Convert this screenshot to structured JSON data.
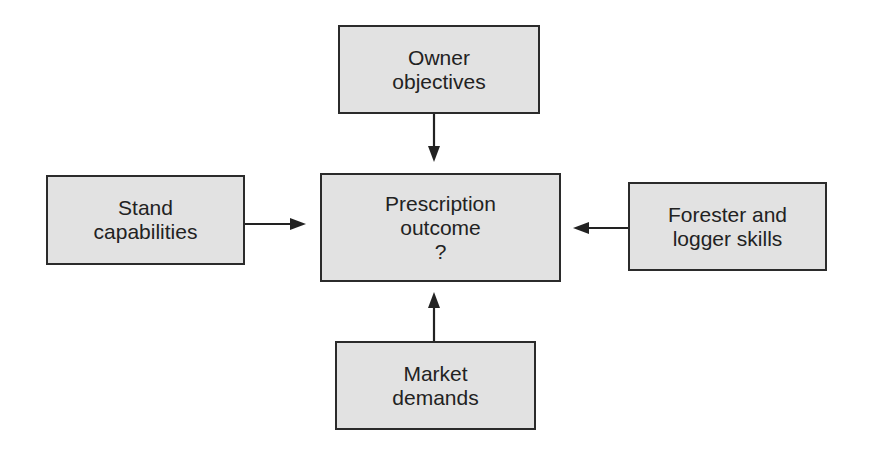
{
  "diagram": {
    "type": "flow",
    "center": {
      "lines": [
        "Prescription",
        "outcome",
        "?"
      ]
    },
    "inputs": {
      "top": {
        "lines": [
          "Owner",
          "objectives"
        ]
      },
      "left": {
        "lines": [
          "Stand",
          "capabilities"
        ]
      },
      "right": {
        "lines": [
          "Forester and",
          "logger skills"
        ]
      },
      "bottom": {
        "lines": [
          "Market",
          "demands"
        ]
      }
    },
    "colors": {
      "box_fill": "#e2e2e2",
      "box_border": "#2b2b2b",
      "arrow": "#222222",
      "text": "#222222",
      "background": "#ffffff"
    },
    "edges": [
      {
        "from": "Owner objectives",
        "to": "Prescription outcome ?"
      },
      {
        "from": "Stand capabilities",
        "to": "Prescription outcome ?"
      },
      {
        "from": "Forester and logger skills",
        "to": "Prescription outcome ?"
      },
      {
        "from": "Market demands",
        "to": "Prescription outcome ?"
      }
    ]
  }
}
